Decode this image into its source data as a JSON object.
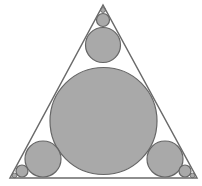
{
  "canvas": {
    "width": 202,
    "height": 186,
    "background": "#ffffff"
  },
  "colors": {
    "circle_fill": "#a9a9a9",
    "circle_stroke": "#666666",
    "triangle_stroke": "#6a6a6a"
  },
  "triangle": {
    "points": [
      [
        103,
        5
      ],
      [
        10,
        178
      ],
      [
        197,
        178
      ]
    ],
    "stroke_width": 1.5
  },
  "circles": [
    {
      "id": "incircle",
      "cx": 103.5,
      "cy": 121,
      "r": 53.5
    },
    {
      "id": "top-medium",
      "cx": 103,
      "cy": 45,
      "r": 17.5
    },
    {
      "id": "top-small",
      "cx": 103,
      "cy": 20,
      "r": 6.5
    },
    {
      "id": "top-tiny",
      "cx": 103,
      "cy": 10,
      "r": 2.5
    },
    {
      "id": "left-medium",
      "cx": 43,
      "cy": 159,
      "r": 18
    },
    {
      "id": "left-small",
      "cx": 22,
      "cy": 171,
      "r": 6
    },
    {
      "id": "left-tiny",
      "cx": 14.5,
      "cy": 175.5,
      "r": 2.3
    },
    {
      "id": "right-medium",
      "cx": 165,
      "cy": 159,
      "r": 18
    },
    {
      "id": "right-small",
      "cx": 185,
      "cy": 171,
      "r": 6
    },
    {
      "id": "right-tiny",
      "cx": 192.5,
      "cy": 175.5,
      "r": 2.3
    }
  ]
}
